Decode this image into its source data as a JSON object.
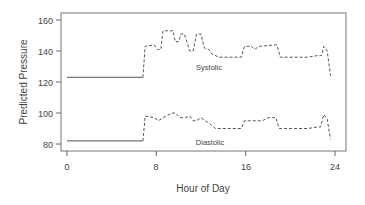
{
  "chart_data": {
    "type": "line",
    "title": "",
    "xlabel": "Hour of Day",
    "ylabel": "Predicted Pressure",
    "xlim": [
      0,
      24
    ],
    "ylim": [
      76,
      164
    ],
    "xticks": [
      0,
      8,
      16,
      24
    ],
    "yticks": [
      80,
      100,
      120,
      140,
      160
    ],
    "grid": false,
    "legend": "inline annotations",
    "annotations": [
      {
        "text": "Systolic",
        "x": 13.0,
        "y": 132
      },
      {
        "text": "Diastolic",
        "x": 13.0,
        "y": 85
      }
    ],
    "series": [
      {
        "name": "Systolic",
        "x": [
          0,
          6.8,
          7.0,
          7.8,
          8.1,
          8.4,
          8.6,
          9.5,
          9.7,
          10.0,
          10.2,
          10.5,
          11.0,
          11.3,
          11.6,
          12.0,
          12.3,
          12.7,
          13.0,
          13.6,
          15.6,
          15.9,
          16.5,
          16.8,
          17.2,
          18.8,
          19.1,
          21.6,
          22.4,
          22.8,
          23.0,
          23.3,
          23.6
        ],
        "values": [
          123,
          123,
          143,
          144,
          141,
          141,
          153,
          153,
          146,
          146,
          151,
          151,
          140,
          140,
          151,
          151,
          142,
          141,
          138,
          136,
          136,
          143,
          143,
          141,
          143,
          144,
          136,
          136,
          137,
          137,
          143,
          140,
          124
        ],
        "style_switch": {
          "solid_until": 6.8,
          "dashed_from": 6.8
        }
      },
      {
        "name": "Diastolic",
        "x": [
          0,
          6.8,
          7.0,
          7.8,
          8.2,
          8.6,
          9.4,
          9.7,
          10.1,
          10.6,
          11.0,
          11.3,
          11.6,
          12.0,
          12.4,
          12.8,
          13.3,
          15.6,
          15.9,
          17.5,
          18.0,
          18.7,
          19.0,
          21.6,
          22.4,
          22.7,
          23.0,
          23.3,
          23.6
        ],
        "values": [
          82,
          82,
          98,
          97,
          95,
          97,
          100,
          100,
          97,
          97,
          98,
          95,
          95,
          97,
          95,
          93,
          90,
          90,
          95,
          95,
          97,
          97,
          90,
          90,
          91,
          91,
          99,
          96,
          83
        ],
        "style_switch": {
          "solid_until": 6.8,
          "dashed_from": 6.8
        }
      }
    ]
  },
  "labels": {
    "xlabel": "Hour of Day",
    "ylabel": "Predicted Pressure",
    "systolic": "Systolic",
    "diastolic": "Diastolic",
    "xticks": [
      "0",
      "8",
      "16",
      "24"
    ],
    "yticks": [
      "80",
      "100",
      "120",
      "140",
      "160"
    ]
  },
  "colors": {
    "line": "#555555",
    "axis": "#666666",
    "text": "#444444"
  }
}
